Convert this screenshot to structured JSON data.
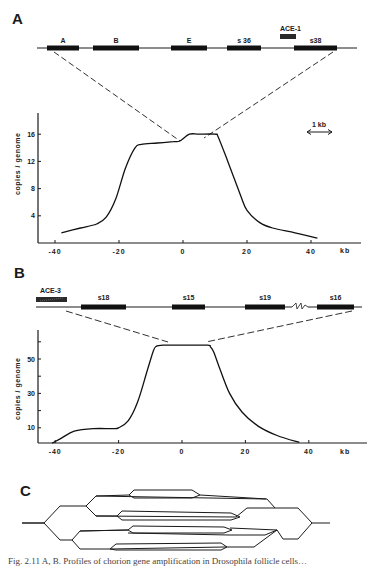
{
  "panels": {
    "A": {
      "label": "A",
      "map": {
        "genes": [
          {
            "name": "A",
            "x1": 47,
            "x2": 79
          },
          {
            "name": "B",
            "x1": 93,
            "x2": 139
          },
          {
            "name": "E",
            "x1": 171,
            "x2": 207
          },
          {
            "name": "s 36",
            "x1": 227,
            "x2": 261
          },
          {
            "name": "s38",
            "x1": 294,
            "x2": 337
          }
        ],
        "element": {
          "name": "ACE-1"
        }
      },
      "scale_bar": "1 kb"
    },
    "B": {
      "label": "B",
      "map": {
        "genes": [
          {
            "name": "s18",
            "x1": 81,
            "x2": 126
          },
          {
            "name": "s15",
            "x1": 172,
            "x2": 205
          },
          {
            "name": "s19",
            "x1": 245,
            "x2": 285
          },
          {
            "name": "s16",
            "x1": 317,
            "x2": 354
          }
        ],
        "element": {
          "name": "ACE-3"
        }
      }
    },
    "C": {
      "label": "C",
      "description": "Onion-skin replication bubble model"
    }
  },
  "chart_data": [
    {
      "type": "line",
      "panel": "A",
      "title": "",
      "xlabel": "kb",
      "ylabel": "copies / genome",
      "x_ticks": [
        -40,
        -20,
        0,
        20,
        40
      ],
      "y_ticks": [
        4,
        8,
        12,
        16
      ],
      "xlim": [
        -46,
        56
      ],
      "ylim": [
        0,
        19
      ],
      "grid": false,
      "series": [
        {
          "name": "amplification profile",
          "x": [
            -38,
            -32,
            -27,
            -24,
            -21,
            -18,
            -15,
            -13,
            -8,
            -3,
            -1,
            2,
            5,
            10,
            11,
            14,
            18,
            20,
            24,
            28,
            35,
            42
          ],
          "y": [
            1.5,
            2.2,
            2.8,
            3.8,
            6.5,
            11,
            14,
            14.5,
            14.7,
            14.9,
            15,
            16,
            16,
            16,
            15.6,
            12,
            7,
            4.8,
            3,
            2.2,
            1.5,
            0.7
          ]
        }
      ]
    },
    {
      "type": "line",
      "panel": "B",
      "title": "",
      "xlabel": "kb",
      "ylabel": "copies / genome",
      "x_ticks": [
        -40,
        -20,
        0,
        20,
        40
      ],
      "y_ticks": [
        10,
        30,
        50
      ],
      "y_minor_ticks": [
        20,
        40,
        60
      ],
      "xlim": [
        -46,
        56
      ],
      "ylim": [
        0,
        67
      ],
      "grid": false,
      "series": [
        {
          "name": "amplification profile",
          "x": [
            -41,
            -38,
            -34,
            -28,
            -22,
            -20,
            -17,
            -14,
            -11,
            -9,
            -8,
            -6,
            0,
            8,
            9,
            10,
            12,
            15,
            19,
            24,
            30,
            37
          ],
          "y": [
            1,
            4,
            8,
            9.5,
            9.5,
            10,
            14,
            25,
            43,
            55,
            57.5,
            58,
            58,
            58,
            57,
            54,
            44,
            30,
            19,
            11,
            5.5,
            1.5
          ]
        }
      ]
    }
  ],
  "axes": {
    "ylabel": "copies / genome",
    "xunit": "kb",
    "A_yticks": [
      "16",
      "12",
      "8",
      "4"
    ],
    "B_yticks": [
      "50",
      "30",
      "10"
    ],
    "xticks": [
      "-40",
      "-20",
      "0",
      "20",
      "40"
    ]
  },
  "caption": "Fig. 2.11  A, B. Profiles of chorion gene amplification in Drosophila follicle cells…"
}
